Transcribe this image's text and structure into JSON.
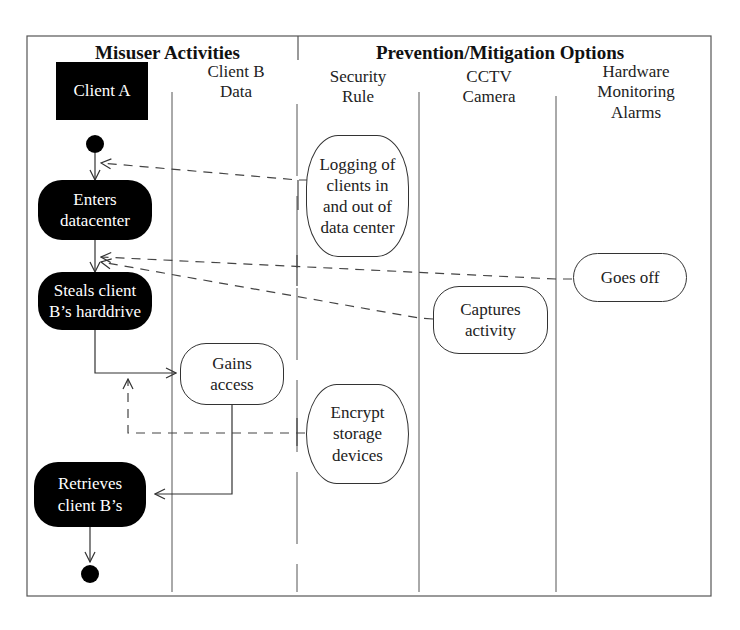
{
  "diagram": {
    "title_groups": {
      "left": "Misuser Activities",
      "right": "Prevention/Mitigation Options"
    },
    "lanes": [
      {
        "id": "client-a",
        "label": "Client A"
      },
      {
        "id": "client-b-data",
        "label_line1": "Client B",
        "label_line2": "Data"
      },
      {
        "id": "security-rule",
        "label_line1": "Security",
        "label_line2": "Rule"
      },
      {
        "id": "cctv-camera",
        "label_line1": "CCTV",
        "label_line2": "Camera"
      },
      {
        "id": "hardware-monitoring-alarms",
        "label_line1": "Hardware",
        "label_line2": "Monitoring",
        "label_line3": "Alarms"
      }
    ],
    "nodes": {
      "enters_datacenter": {
        "line1": "Enters",
        "line2": "datacenter",
        "lane": "Client A",
        "style": "misuse"
      },
      "steals_harddrive": {
        "line1": "Steals client",
        "line2": "B’s harddrive",
        "lane": "Client A",
        "style": "misuse"
      },
      "retrieves": {
        "line1": "Retrieves",
        "line2": "client B’s",
        "lane": "Client A",
        "style": "misuse"
      },
      "gains_access": {
        "line1": "Gains",
        "line2": "access",
        "lane": "Client B Data",
        "style": "activity"
      },
      "logging": {
        "line1": "Logging of",
        "line2": "clients in",
        "line3": "and out of",
        "line4": "data center",
        "lane": "Security Rule",
        "style": "mitigation"
      },
      "encrypt": {
        "line1": "Encrypt",
        "line2": "storage",
        "line3": "devices",
        "lane": "Security Rule",
        "style": "mitigation"
      },
      "captures": {
        "line1": "Captures",
        "line2": "activity",
        "lane": "CCTV Camera",
        "style": "mitigation"
      },
      "goes_off": {
        "line1": "Goes off",
        "lane": "Hardware Monitoring Alarms",
        "style": "mitigation"
      }
    },
    "edges": [
      {
        "from": "start",
        "to": "Enters datacenter",
        "type": "control-flow"
      },
      {
        "from": "Enters datacenter",
        "to": "Steals client B’s harddrive",
        "type": "control-flow"
      },
      {
        "from": "Steals client B’s harddrive",
        "to": "Gains access",
        "type": "control-flow"
      },
      {
        "from": "Gains access",
        "to": "Retrieves client B’s",
        "type": "control-flow"
      },
      {
        "from": "Retrieves client B’s",
        "to": "end",
        "type": "control-flow"
      },
      {
        "from": "Logging of clients in and out of data center",
        "to": "start→Enters datacenter",
        "type": "mitigates-dashed"
      },
      {
        "from": "Goes off",
        "to": "Enters datacenter→Steals harddrive",
        "type": "mitigates-dashed"
      },
      {
        "from": "Captures activity",
        "to": "Enters datacenter→Steals harddrive",
        "type": "mitigates-dashed"
      },
      {
        "from": "Encrypt storage devices",
        "to": "Steals harddrive→Gains access",
        "type": "mitigates-dashed"
      }
    ],
    "colors": {
      "misuse_fill": "#000000",
      "line": "#333333",
      "background": "#ffffff"
    }
  }
}
